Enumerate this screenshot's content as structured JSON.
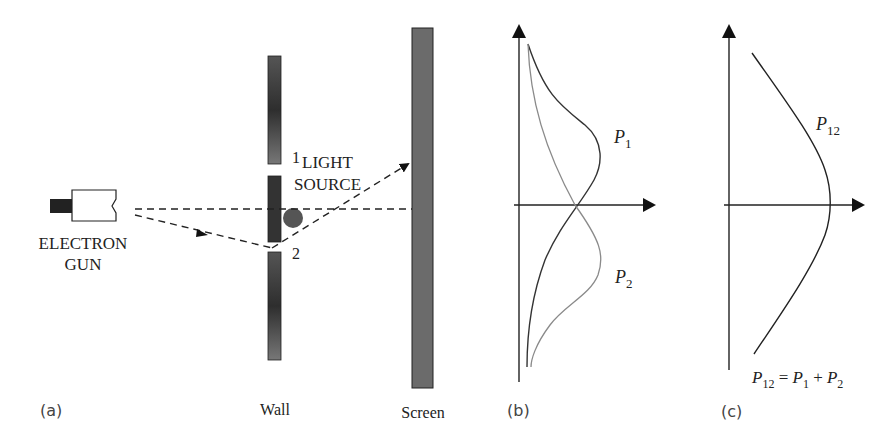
{
  "panel_a": {
    "gun_label_line1": "ELECTRON",
    "gun_label_line2": "GUN",
    "slit1_label": "1",
    "light_source_line1": "LIGHT",
    "light_source_line2": "SOURCE",
    "slit2_label": "2",
    "wall_label": "Wall",
    "screen_label": "Screen",
    "caption": "(a)"
  },
  "panel_b": {
    "p1_label": "P",
    "p1_sub": "1",
    "p2_label": "P",
    "p2_sub": "2",
    "caption": "(b)"
  },
  "panel_c": {
    "p12_label": "P",
    "p12_sub": "12",
    "equation": {
      "lhs": "P",
      "lhs_sub": "12",
      "eq": " = ",
      "t1": "P",
      "t1_sub": "1",
      "plus": " + ",
      "t2": "P",
      "t2_sub": "2"
    },
    "caption": "(c)"
  },
  "colors": {
    "wall": "#3a3a3a",
    "screen": "#6b6b6b",
    "light_source": "#555555",
    "line": "#222222",
    "curve_p2": "#8a8a8a"
  }
}
